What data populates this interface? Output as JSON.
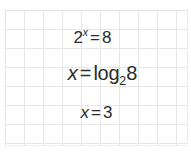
{
  "worksheet": {
    "title": "Logarithm solution steps on grid paper",
    "background_color": "#ffffff",
    "grid_line_color": "#e6e6e6",
    "text_color": "#2b2b2b",
    "grid": {
      "cell_size_px": 19,
      "columns": 10,
      "rows": 7
    }
  },
  "equations": [
    {
      "id": "exponential-equation",
      "plain_text": "2^x = 8",
      "base": "2",
      "exponent": "x",
      "operator": "=",
      "result": "8"
    },
    {
      "id": "logarithm-equation",
      "plain_text": "x = log2 8",
      "variable": "x",
      "operator": "=",
      "function": "log",
      "log_base": "2",
      "argument": "8"
    },
    {
      "id": "solution-equation",
      "plain_text": "x = 3",
      "variable": "x",
      "operator": "=",
      "value": "3"
    }
  ]
}
